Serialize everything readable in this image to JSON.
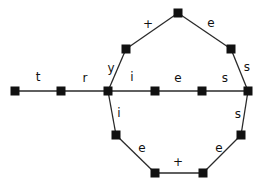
{
  "diagram": {
    "type": "automaton-graph",
    "colors": {
      "edge": "#2a2a2a",
      "node": "#111111",
      "background": "#ffffff"
    },
    "nodes": [
      {
        "id": "n1",
        "x": 15,
        "y": 91
      },
      {
        "id": "n2",
        "x": 61,
        "y": 91
      },
      {
        "id": "n3",
        "x": 108,
        "y": 91
      },
      {
        "id": "n4",
        "x": 155,
        "y": 91
      },
      {
        "id": "n5",
        "x": 202,
        "y": 91
      },
      {
        "id": "n6",
        "x": 248,
        "y": 91
      },
      {
        "id": "n7",
        "x": 126,
        "y": 49
      },
      {
        "id": "n8",
        "x": 178,
        "y": 13
      },
      {
        "id": "n9",
        "x": 231,
        "y": 49
      },
      {
        "id": "n10",
        "x": 116,
        "y": 135
      },
      {
        "id": "n11",
        "x": 155,
        "y": 173
      },
      {
        "id": "n12",
        "x": 203,
        "y": 173
      },
      {
        "id": "n13",
        "x": 241,
        "y": 135
      }
    ],
    "edges": [
      {
        "from": "n1",
        "to": "n2",
        "label": "t",
        "lx": 38,
        "ly": 77
      },
      {
        "from": "n2",
        "to": "n3",
        "label": "r",
        "lx": 85,
        "ly": 78
      },
      {
        "from": "n3",
        "to": "n7",
        "label": "y",
        "lx": 111,
        "ly": 68
      },
      {
        "from": "n7",
        "to": "n8",
        "label": "+",
        "lx": 148,
        "ly": 24
      },
      {
        "from": "n8",
        "to": "n9",
        "label": "e",
        "lx": 211,
        "ly": 23
      },
      {
        "from": "n9",
        "to": "n6",
        "label": "s",
        "lx": 247,
        "ly": 67
      },
      {
        "from": "n3",
        "to": "n4",
        "label": "i",
        "lx": 132,
        "ly": 77
      },
      {
        "from": "n4",
        "to": "n5",
        "label": "e",
        "lx": 178,
        "ly": 78
      },
      {
        "from": "n5",
        "to": "n6",
        "label": "s",
        "lx": 225,
        "ly": 78
      },
      {
        "from": "n3",
        "to": "n10",
        "label": "i",
        "lx": 119,
        "ly": 113
      },
      {
        "from": "n10",
        "to": "n11",
        "label": "e",
        "lx": 142,
        "ly": 148
      },
      {
        "from": "n11",
        "to": "n12",
        "label": "+",
        "lx": 178,
        "ly": 162
      },
      {
        "from": "n12",
        "to": "n13",
        "label": "e",
        "lx": 219,
        "ly": 148
      },
      {
        "from": "n13",
        "to": "n6",
        "label": "s",
        "lx": 238,
        "ly": 114
      }
    ]
  }
}
